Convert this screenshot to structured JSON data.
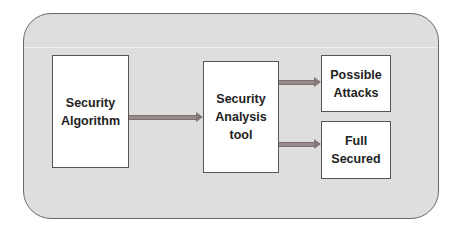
{
  "diagram": {
    "type": "flowchart",
    "container": {
      "shape": "rounded-rectangle",
      "fill": "#dedede",
      "stroke": "#6a6a6a"
    },
    "nodes": [
      {
        "id": "security_algorithm",
        "lines": [
          "Security",
          "Algorithm"
        ]
      },
      {
        "id": "security_analysis_tool",
        "lines": [
          "Security",
          "Analysis",
          "tool"
        ]
      },
      {
        "id": "possible_attacks",
        "lines": [
          "Possible",
          "Attacks"
        ]
      },
      {
        "id": "full_secured",
        "lines": [
          "Full",
          "Secured"
        ]
      }
    ],
    "edges": [
      {
        "from": "security_algorithm",
        "to": "security_analysis_tool"
      },
      {
        "from": "security_analysis_tool",
        "to": "possible_attacks"
      },
      {
        "from": "security_analysis_tool",
        "to": "full_secured"
      }
    ],
    "colors": {
      "box_fill": "#ffffff",
      "box_stroke": "#555555",
      "arrow": "#9a8a8a",
      "text": "#222222"
    }
  }
}
